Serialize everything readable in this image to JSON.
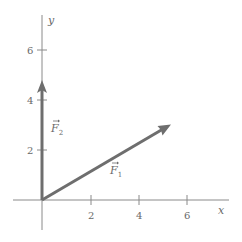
{
  "diagram": {
    "type": "vector-diagram",
    "axes": {
      "x_label": "x",
      "y_label": "y",
      "x_ticks": [
        {
          "value": 2,
          "label": "2"
        },
        {
          "value": 4,
          "label": "4"
        },
        {
          "value": 6,
          "label": "6"
        }
      ],
      "y_ticks": [
        {
          "value": 2,
          "label": "2"
        },
        {
          "value": 4,
          "label": "4"
        },
        {
          "value": 6,
          "label": "6"
        }
      ]
    },
    "vectors": [
      {
        "name": "F1",
        "label": "F",
        "subscript": "1",
        "from": [
          0,
          0
        ],
        "to": [
          5.2,
          3.0
        ]
      },
      {
        "name": "F2",
        "label": "F",
        "subscript": "2",
        "from": [
          0,
          0
        ],
        "to": [
          0,
          4.8
        ]
      }
    ],
    "colors": {
      "axis": "#8a8a8a",
      "vector": "#6e6e6e",
      "text": "#6a6a6a"
    }
  }
}
